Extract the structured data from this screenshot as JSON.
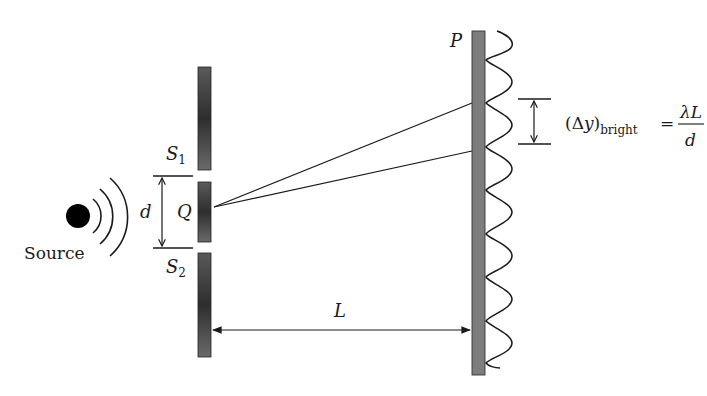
{
  "diagram": {
    "labels": {
      "source": "Source",
      "slit1_main": "S",
      "slit1_sub": "1",
      "slit2_main": "S",
      "slit2_sub": "2",
      "slit_separation": "d",
      "center_point": "Q",
      "screen": "P",
      "distance": "L"
    },
    "formula": {
      "lhs_open": "(",
      "lhs_delta": "Δ",
      "lhs_var": "y",
      "lhs_close": ")",
      "lhs_sub": "bright",
      "equals": "=",
      "numerator": "λL",
      "denominator": "d"
    },
    "colors": {
      "barrier": "#3a3a3a",
      "screen": "#7a7a7a",
      "line": "#1a1a1a"
    }
  }
}
